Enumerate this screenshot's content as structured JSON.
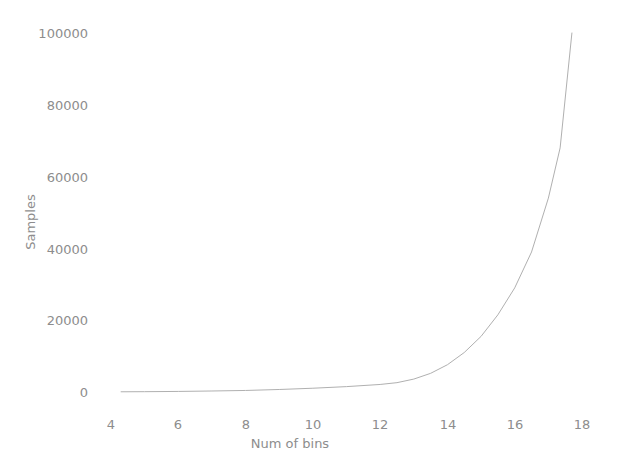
{
  "chart_data": {
    "type": "line",
    "title": "",
    "xlabel": "Num of bins",
    "ylabel": "Samples",
    "xlim": [
      4.0,
      18.0
    ],
    "ylim": [
      0,
      100000
    ],
    "grid": false,
    "legend": null,
    "xticks": [
      "4",
      "6",
      "8",
      "10",
      "12",
      "14",
      "16",
      "18"
    ],
    "xtick_values": [
      4,
      6,
      8,
      10,
      12,
      14,
      16,
      18
    ],
    "yticks": [
      "0",
      "20000",
      "40000",
      "60000",
      "80000",
      "100000"
    ],
    "ytick_values": [
      0,
      20000,
      40000,
      60000,
      80000,
      100000
    ],
    "line_color": "#b0b0b0",
    "line_width": 1.0,
    "series": [
      {
        "name": "samples",
        "x": [
          4.3,
          5.0,
          6.0,
          7.0,
          8.0,
          9.0,
          10.0,
          11.0,
          12.0,
          12.5,
          13.0,
          13.5,
          14.0,
          14.5,
          15.0,
          15.5,
          16.0,
          16.5,
          17.0,
          17.35,
          17.7
        ],
        "y": [
          60,
          90,
          160,
          280,
          430,
          700,
          1050,
          1500,
          2100,
          2600,
          3600,
          5200,
          7600,
          11000,
          15500,
          21500,
          29000,
          39000,
          54000,
          68000,
          100000
        ]
      }
    ]
  },
  "axes": {
    "ylabel_text": "Samples",
    "xlabel_text": "Num of bins"
  },
  "colors": {
    "background": "#ffffff",
    "text": "#8d8d8d",
    "line": "#b0b0b0"
  }
}
